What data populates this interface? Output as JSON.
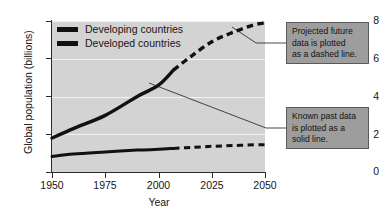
{
  "chart_data": {
    "type": "line",
    "title": "",
    "xlabel": "Year",
    "ylabel": "Global population (billions)",
    "xlim": [
      1950,
      2050
    ],
    "ylim": [
      0,
      8
    ],
    "xticks": [
      1950,
      1975,
      2000,
      2025,
      2050
    ],
    "yticks": [
      0,
      2,
      4,
      6,
      8
    ],
    "grid": true,
    "legend_position": "top-left",
    "series": [
      {
        "name": "Developing countries",
        "style": "solid-then-dashed",
        "split_year": 2007,
        "x": [
          1950,
          1960,
          1975,
          1990,
          2000,
          2007,
          2015,
          2025,
          2035,
          2045,
          2050
        ],
        "values": [
          1.8,
          2.3,
          3.0,
          4.0,
          4.6,
          5.4,
          6.1,
          6.9,
          7.4,
          7.8,
          7.9
        ]
      },
      {
        "name": "Developed countries",
        "style": "solid-then-dashed",
        "split_year": 2007,
        "x": [
          1950,
          1960,
          1975,
          1990,
          2000,
          2007,
          2015,
          2025,
          2035,
          2045,
          2050
        ],
        "values": [
          0.82,
          0.95,
          1.06,
          1.16,
          1.2,
          1.25,
          1.3,
          1.36,
          1.4,
          1.44,
          1.45
        ]
      }
    ],
    "annotations": [
      {
        "id": "projected",
        "lines": [
          "Projected future",
          "data is plotted",
          "as a dashed line."
        ],
        "target_series": "Developing countries",
        "target_year": 2034
      },
      {
        "id": "known",
        "lines": [
          "Known past data",
          "is plotted as a",
          "solid line."
        ],
        "target_series": "Developing countries",
        "target_year": 1996
      }
    ]
  },
  "axes": {
    "y_title": "Global population (billions)",
    "x_title": "Year",
    "y_tick_labels": [
      "0",
      "2",
      "4",
      "6",
      "8"
    ],
    "x_tick_labels": [
      "1950",
      "1975",
      "2000",
      "2025",
      "2050"
    ]
  },
  "legend": {
    "items": [
      {
        "label": "Developing countries"
      },
      {
        "label": "Developed countries"
      }
    ]
  },
  "annotations": {
    "projected": {
      "line1": "Projected future",
      "line2": "data is plotted",
      "line3": "as a dashed line."
    },
    "known": {
      "line1": "Known past data",
      "line2": "is plotted as a",
      "line3": "solid line."
    }
  },
  "colors": {
    "plot_background": "#d3d3d3",
    "gridline": "#f2f2f2",
    "line": "#111111",
    "callout_background": "#9d9d9d",
    "callout_border": "#5a5a5a",
    "page_background": "#ffffff"
  }
}
